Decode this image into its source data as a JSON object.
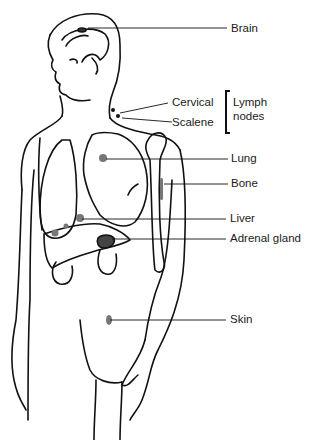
{
  "diagram": {
    "labels": {
      "brain": "Brain",
      "cervical": "Cervical",
      "scalene": "Scalene",
      "lymph_nodes_line1": "Lymph",
      "lymph_nodes_line2": "nodes",
      "lung": "Lung",
      "bone": "Bone",
      "liver": "Liver",
      "adrenal_gland": "Adrenal gland",
      "skin": "Skin"
    },
    "groups": [
      {
        "name": "Lymph nodes",
        "members": [
          "Cervical",
          "Scalene"
        ]
      }
    ],
    "colors": {
      "line": "#111111",
      "lesion": "#777777",
      "background": "#ffffff"
    }
  }
}
